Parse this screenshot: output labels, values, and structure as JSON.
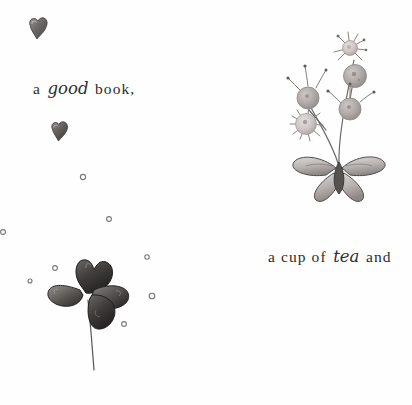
{
  "page": {
    "title": "a good book, a cup of tea and",
    "background_color": "#fefefe",
    "width": 412,
    "height": 405
  },
  "captions": [
    {
      "id": "book",
      "prefix": "a ",
      "script_word": "good",
      "suffix": " book,",
      "full_text": "a good book,",
      "x": 33,
      "y": 79
    },
    {
      "id": "tea",
      "prefix": "a cup of ",
      "script_word": "tea",
      "suffix": " and",
      "full_text": "a cup of tea and",
      "x": 268,
      "y": 247
    }
  ],
  "illustrations": [
    {
      "name": "dandelion-plant",
      "description": "dandelion seed heads on curved stems rising from a butterfly-like petal base",
      "x": 276,
      "y": 18,
      "ink_color": "#5d5a58",
      "fill_color": "#a9a4a1",
      "light_fill": "#cfcbc8"
    },
    {
      "name": "four-leaf-clover",
      "description": "four heart shaped leaves on a long thin curving stem",
      "x": 36,
      "y": 246,
      "ink_color": "#2e2c2b",
      "fill_color": "#54514f"
    },
    {
      "name": "heart-top-left",
      "description": "small shaded heart",
      "x": 23,
      "y": 12,
      "fill_color": "#6e6b69"
    },
    {
      "name": "heart-middle-left",
      "description": "small shaded heart",
      "x": 47,
      "y": 117,
      "fill_color": "#5a5755"
    }
  ],
  "specks": [
    {
      "x": 83,
      "y": 177,
      "r": 2.6
    },
    {
      "x": 109,
      "y": 219,
      "r": 2.4
    },
    {
      "x": 3,
      "y": 232,
      "r": 2.4
    },
    {
      "x": 147,
      "y": 257,
      "r": 2.2
    },
    {
      "x": 55,
      "y": 268,
      "r": 2.4
    },
    {
      "x": 152,
      "y": 296,
      "r": 2.8
    },
    {
      "x": 124,
      "y": 324,
      "r": 2.4
    },
    {
      "x": 30,
      "y": 281,
      "r": 2.0
    }
  ],
  "colors": {
    "ink": "#4a4745",
    "soft_grey": "#b0abA8",
    "dark_leaf": "#33302f",
    "paper": "#fefefe"
  }
}
